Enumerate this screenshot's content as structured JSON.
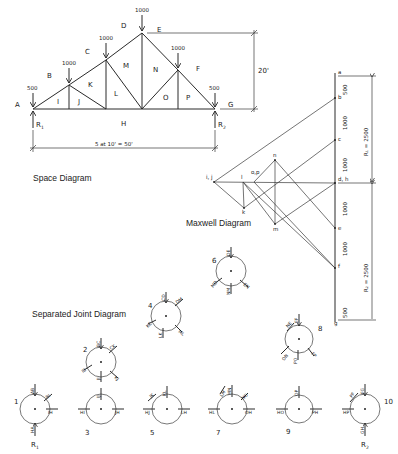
{
  "captions": {
    "space": "Space Diagram",
    "maxwell": "Maxwell Diagram",
    "separated": "Separated Joint Diagram"
  },
  "space_diagram": {
    "regions": {
      "A": "A",
      "B": "B",
      "C": "C",
      "D": "D",
      "E": "E",
      "F": "F",
      "G": "G",
      "H": "H",
      "I": "I",
      "J": "J",
      "K": "K",
      "L": "L",
      "M": "M",
      "N": "N",
      "O": "O",
      "P": "P"
    },
    "loads": {
      "left_end": "500",
      "b": "1000",
      "c": "1000",
      "apex": "1000",
      "f": "1000",
      "right_end": "500"
    },
    "reactions": {
      "left": "R",
      "left_sub": "1",
      "right": "R",
      "right_sub": "2"
    },
    "height_dim": "20'",
    "span_dim": "5 at 10'  =  50'"
  },
  "maxwell_diagram": {
    "points": {
      "a": "a",
      "b": "b",
      "c": "c",
      "dh": "d, h",
      "e": "e",
      "f": "f",
      "g": "g",
      "ij": "i, j",
      "l": "l",
      "op": "o,p",
      "n": "n",
      "k": "k",
      "m": "m"
    },
    "segments": {
      "ab": "500",
      "bc": "1000",
      "cd": "1000",
      "de": "1000",
      "ef": "1000",
      "fg": "500"
    },
    "r1": "R₁  =  2500",
    "r2": "R₂  =  2500"
  },
  "joints": [
    {
      "id": "1",
      "members": [
        "AB",
        "BI",
        "IH",
        "HA"
      ],
      "reaction": "R",
      "reaction_sub": "1"
    },
    {
      "id": "2",
      "members": [
        "BC",
        "CK",
        "KJ",
        "JI",
        "IB"
      ]
    },
    {
      "id": "3",
      "members": [
        "IJ",
        "HI",
        "JH"
      ]
    },
    {
      "id": "4",
      "members": [
        "CD",
        "DM",
        "ML",
        "LK",
        "KC"
      ]
    },
    {
      "id": "5",
      "members": [
        "JK",
        "KL",
        "HJ",
        "LH"
      ]
    },
    {
      "id": "6",
      "members": [
        "DE",
        "EN",
        "NM",
        "MD"
      ]
    },
    {
      "id": "7",
      "members": [
        "LM",
        "MN",
        "NO",
        "HL",
        "OH"
      ]
    },
    {
      "id": "8",
      "members": [
        "EF",
        "FP",
        "PO",
        "ON",
        "NE"
      ]
    },
    {
      "id": "9",
      "members": [
        "OP",
        "HO",
        "PH"
      ]
    },
    {
      "id": "10",
      "members": [
        "FG",
        "PF",
        "HP",
        "GH"
      ],
      "reaction": "R",
      "reaction_sub": "2"
    }
  ]
}
